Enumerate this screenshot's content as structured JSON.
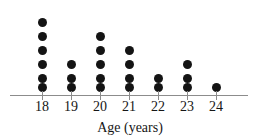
{
  "chart_data": {
    "type": "scatter",
    "plot_style": "dot-plot",
    "title": "",
    "subtitle": "",
    "xlabel": "Age (years)",
    "ylabel": "",
    "categories": [
      "18",
      "19",
      "20",
      "21",
      "22",
      "23",
      "24"
    ],
    "values": [
      6,
      3,
      5,
      4,
      2,
      3,
      1
    ],
    "series": [
      {
        "name": "Count",
        "values": [
          6,
          3,
          5,
          4,
          2,
          3,
          1
        ]
      }
    ],
    "x": [
      18,
      19,
      20,
      21,
      22,
      23,
      24
    ],
    "xlim": [
      17.5,
      24.9
    ],
    "ylim": [
      0,
      6
    ],
    "grid": false,
    "legend": false,
    "legend_position": "none",
    "total_observations": 24,
    "annotations": [],
    "dot_color": "#141414",
    "axis_color": "#8c8c8c",
    "background_color": "#ffffff",
    "tick_labels": [
      "18",
      "19",
      "20",
      "21",
      "22",
      "23",
      "24"
    ]
  },
  "axis": {
    "title": "Age (years)"
  }
}
